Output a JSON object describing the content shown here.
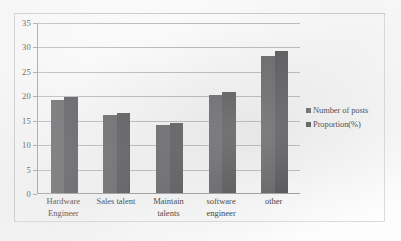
{
  "chart_data": {
    "type": "bar",
    "title": "",
    "subtitle": "",
    "xlabel": "",
    "ylabel": "",
    "ylim": [
      0,
      35
    ],
    "ytick_labels": [
      "0",
      "5",
      "10",
      "15",
      "20",
      "25",
      "30",
      "35"
    ],
    "ytick_values": [
      0,
      5,
      10,
      15,
      20,
      25,
      30,
      35
    ],
    "grid": true,
    "legend_position": "right",
    "categories": [
      "Hardware\nEngineer",
      "Sales talent",
      "Maintain\ntalents",
      "software\nengineer",
      "other"
    ],
    "category_lines": [
      [
        "Hardware",
        "Engineer"
      ],
      [
        "Sales talent"
      ],
      [
        "Maintain",
        "talents"
      ],
      [
        "software",
        "engineer"
      ],
      [
        "other"
      ]
    ],
    "series": [
      {
        "name": "Number of posts",
        "color": "#5b5b5d",
        "values": [
          19,
          15.9,
          14,
          20,
          28
        ]
      },
      {
        "name": "Proportion(%)",
        "color": "#4a4a4c",
        "values": [
          19.6,
          16.4,
          14.4,
          20.6,
          29
        ]
      }
    ]
  },
  "legend": {
    "marker_icon": "square-marker-icon",
    "entries": [
      {
        "label": "Number of posts",
        "color": "#5b5b5d"
      },
      {
        "label": "Proportion(%)",
        "color": "#4a4a4c"
      }
    ]
  },
  "colors": {
    "series_1": "#5b5b5d",
    "series_2": "#4a4a4c",
    "gridline": "#b9b9bb",
    "axis": "#9a9a9c",
    "frame": "#c9c9cb",
    "text": "#2d2d2f",
    "background": "#fdfdfd"
  }
}
